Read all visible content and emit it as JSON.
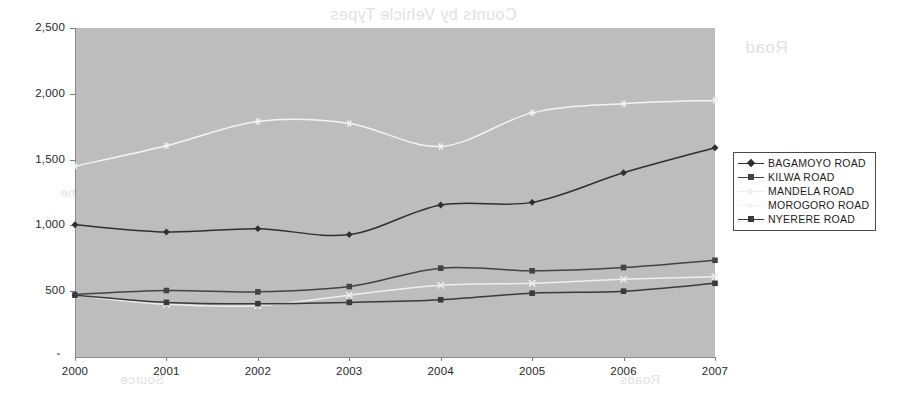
{
  "chart_data": {
    "type": "line",
    "title": "",
    "xlabel": "",
    "ylabel": "",
    "categories": [
      "2000",
      "2001",
      "2002",
      "2003",
      "2004",
      "2005",
      "2006",
      "2007"
    ],
    "x_tick_labels": [
      "2000",
      "2001",
      "2002",
      "2003",
      "2004",
      "2005",
      "2006",
      "2007"
    ],
    "y_tick_labels": [
      "2,500",
      "2,000",
      "1,500",
      "1,000",
      "500"
    ],
    "y_tick_values": [
      2500,
      2000,
      1500,
      1000,
      500
    ],
    "ylim": [
      0,
      2500
    ],
    "grid": false,
    "legend_position": "right",
    "plot_background": "#bdbdbd",
    "series": [
      {
        "name": "BAGAMOYO ROAD",
        "values": [
          1005,
          950,
          975,
          930,
          1155,
          1175,
          1400,
          1590
        ],
        "color": "#2f2f2f",
        "marker": "diamond",
        "legend_label": "BAGAMOYO ROAD"
      },
      {
        "name": "KILWA ROAD",
        "values": [
          475,
          505,
          495,
          535,
          675,
          655,
          680,
          735
        ],
        "color": "#434343",
        "marker": "square",
        "legend_label": "KILWA ROAD"
      },
      {
        "name": "MANDELA ROAD",
        "values": [
          470,
          400,
          390,
          470,
          545,
          560,
          590,
          610
        ],
        "color": "#eceff0",
        "marker": "cross",
        "legend_label": "MANDELA ROAD"
      },
      {
        "name": "MOROGORO ROAD",
        "values": [
          1450,
          1605,
          1790,
          1775,
          1600,
          1855,
          1925,
          1950
        ],
        "color": "#f2f4f4",
        "marker": "star",
        "legend_label": "MOROGORO ROAD"
      },
      {
        "name": "NYERERE ROAD",
        "values": [
          470,
          415,
          405,
          415,
          435,
          485,
          500,
          560
        ],
        "color": "#3a3a3a",
        "marker": "square",
        "legend_label": "NYERERE ROAD"
      }
    ]
  },
  "ghost_text": {
    "line1": "Counts by Vehicle Types",
    "line2": "Road",
    "line3": "Roads",
    "line4": "Source",
    "line5": "Volume"
  }
}
